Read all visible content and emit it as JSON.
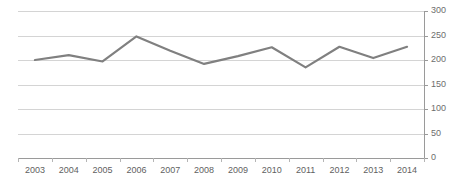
{
  "chart_data": {
    "type": "line",
    "title": "",
    "xlabel": "",
    "ylabel": "",
    "categories": [
      "2003",
      "2004",
      "2005",
      "2006",
      "2007",
      "2008",
      "2009",
      "2010",
      "2011",
      "2012",
      "2013",
      "2014"
    ],
    "values": [
      200,
      210,
      197,
      248,
      219,
      192,
      208,
      226,
      185,
      227,
      204,
      227
    ],
    "series": [
      {
        "name": "",
        "values": [
          200,
          210,
          197,
          248,
          219,
          192,
          208,
          226,
          185,
          227,
          204,
          227
        ],
        "color": "#808080"
      }
    ],
    "ylim": [
      0,
      300
    ],
    "ytick_values": [
      0,
      50,
      100,
      150,
      200,
      250,
      300
    ],
    "ytick_labels": [
      "0",
      "50",
      "100",
      "150",
      "200",
      "250",
      "300"
    ],
    "y_axis_position": "right",
    "grid": true,
    "grid_axis": "y",
    "grid_color": "#d4d4d4",
    "legend": false,
    "legend_position": "none",
    "markers": false,
    "line_color": "#808080",
    "line_width": 2.2,
    "axis_color": "#9a9a9a",
    "tick_label_color": "#5f5f5f",
    "background": "#ffffff"
  }
}
